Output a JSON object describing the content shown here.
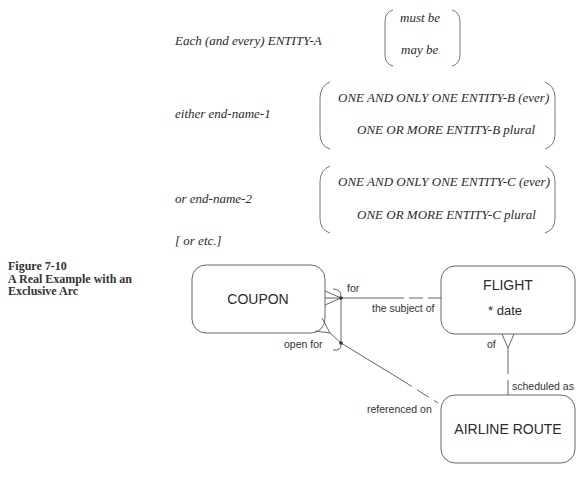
{
  "template": {
    "subject_line": "Each (and every) ENTITY-A",
    "modality": [
      "must be",
      "may be"
    ],
    "either_label": "either end-name-1",
    "either_options": [
      "ONE AND ONLY ONE ENTITY-B (ever)",
      "ONE OR MORE ENTITY-B plural"
    ],
    "or_label": "or end-name-2",
    "or_options": [
      "ONE AND ONLY ONE ENTITY-C (ever)",
      "ONE OR MORE ENTITY-C plural"
    ],
    "etc_label": "[ or etc.]"
  },
  "caption": {
    "figure_number": "Figure 7-10",
    "title_line1": "A Real Example with an",
    "title_line2": "Exclusive Arc"
  },
  "diagram": {
    "entities": {
      "coupon": {
        "name": "COUPON"
      },
      "flight": {
        "name": "FLIGHT",
        "attribute": "* date"
      },
      "airline_route": {
        "name": "AIRLINE ROUTE"
      }
    },
    "relationships": {
      "coupon_flight_coupon_end": "for",
      "coupon_flight_flight_end": "the subject of",
      "coupon_route_coupon_end": "open for",
      "coupon_route_route_end": "referenced on",
      "flight_route_flight_end": "of",
      "flight_route_route_end": "scheduled as"
    }
  }
}
